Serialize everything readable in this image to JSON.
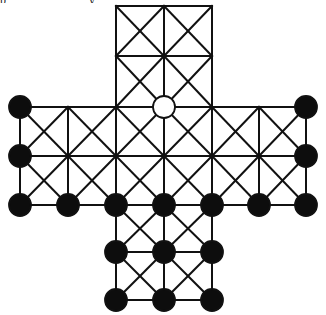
{
  "caption_fragment": "p y",
  "board": {
    "line_color": "#111111",
    "line_width": 2,
    "piece_radius": 11,
    "columns_x": [
      20,
      68,
      116,
      164,
      212,
      259,
      306
    ],
    "rows_y": [
      6,
      56,
      107,
      156,
      205,
      252,
      300
    ],
    "shape": "cross",
    "cells": [
      [
        2,
        0
      ],
      [
        3,
        0
      ],
      [
        2,
        1
      ],
      [
        3,
        1
      ],
      [
        0,
        2
      ],
      [
        1,
        2
      ],
      [
        2,
        2
      ],
      [
        3,
        2
      ],
      [
        4,
        2
      ],
      [
        5,
        2
      ],
      [
        0,
        3
      ],
      [
        1,
        3
      ],
      [
        2,
        3
      ],
      [
        3,
        3
      ],
      [
        4,
        3
      ],
      [
        5,
        3
      ],
      [
        2,
        4
      ],
      [
        3,
        4
      ],
      [
        2,
        5
      ],
      [
        3,
        5
      ]
    ],
    "black_pieces": [
      [
        0,
        2
      ],
      [
        0,
        3
      ],
      [
        0,
        4
      ],
      [
        6,
        2
      ],
      [
        6,
        3
      ],
      [
        6,
        4
      ],
      [
        1,
        4
      ],
      [
        2,
        4
      ],
      [
        3,
        4
      ],
      [
        4,
        4
      ],
      [
        5,
        4
      ],
      [
        2,
        5
      ],
      [
        3,
        5
      ],
      [
        4,
        5
      ],
      [
        2,
        6
      ],
      [
        3,
        6
      ],
      [
        4,
        6
      ]
    ],
    "white_pieces": [
      [
        3,
        2
      ]
    ],
    "black_color": "#0d0d0d",
    "white_color": "#ffffff"
  }
}
